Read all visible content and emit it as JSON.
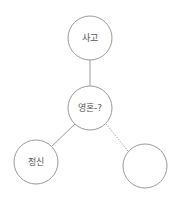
{
  "diagram": {
    "nodes": [
      {
        "id": "thought",
        "label": "사고",
        "cx": 90,
        "cy": 38,
        "r": 22
      },
      {
        "id": "soul",
        "label": "영혼-?",
        "cx": 90,
        "cy": 108,
        "r": 22
      },
      {
        "id": "mind",
        "label": "정신",
        "cx": 36,
        "cy": 162,
        "r": 22
      },
      {
        "id": "empty",
        "label": "",
        "cx": 145,
        "cy": 166,
        "r": 22
      }
    ],
    "edges": [
      {
        "from": "thought",
        "to": "soul",
        "style": "solid"
      },
      {
        "from": "soul",
        "to": "mind",
        "style": "solid"
      },
      {
        "from": "soul",
        "to": "empty",
        "style": "dotted"
      }
    ],
    "colors": {
      "stroke": "#9a9a9a",
      "text": "#555555",
      "background": "#ffffff"
    }
  }
}
